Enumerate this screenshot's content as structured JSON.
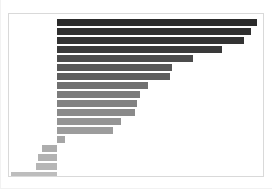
{
  "chart": {
    "title": "",
    "subtitle": "",
    "panel": {
      "background": "#ffffff",
      "border_color": "#d9d9d9"
    }
  },
  "chart_data": {
    "type": "bar",
    "orientation": "horizontal",
    "title": "",
    "subtitle": "",
    "xlabel": "",
    "ylabel": "",
    "grid": false,
    "legend": false,
    "legend_position": "none",
    "baseline_value": 0,
    "baseline_fraction": 0.19,
    "xlim": [
      -25,
      100
    ],
    "categories": [
      "item-01",
      "item-02",
      "item-03",
      "item-04",
      "item-05",
      "item-06",
      "item-07",
      "item-08",
      "item-09",
      "item-10",
      "item-11",
      "item-12",
      "item-13",
      "item-14",
      "item-15",
      "item-16",
      "item-17",
      "item-18"
    ],
    "values": [
      97,
      94,
      91,
      80,
      66,
      56,
      55,
      44,
      40,
      39,
      38,
      31,
      27,
      4,
      -8,
      -10,
      -11,
      -24
    ],
    "colors": [
      "#2b2b2b",
      "#303030",
      "#333333",
      "#3a3a3a",
      "#4c4c4c",
      "#585858",
      "#5e5e5e",
      "#707070",
      "#7b7b7b",
      "#828282",
      "#8a8a8a",
      "#949494",
      "#9c9c9c",
      "#a6a6a6",
      "#adadad",
      "#b2b2b2",
      "#b6b6b6",
      "#bdbdbd"
    ],
    "bar_height_px": 7,
    "row_pitch_px": 9,
    "first_row_top_px": 5
  }
}
